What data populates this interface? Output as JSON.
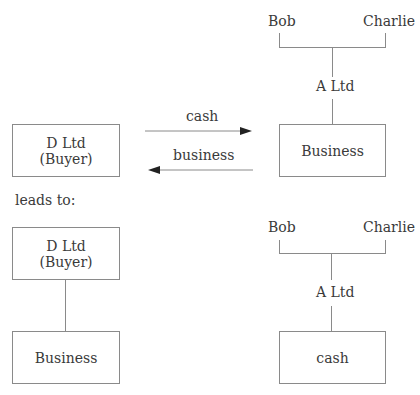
{
  "before": {
    "buyer_box": {
      "line1": "D Ltd",
      "line2": "(Buyer)"
    },
    "arrow_top_label": "cash",
    "arrow_bottom_label": "business",
    "shareholders": [
      "Bob",
      "Charlie"
    ],
    "company": "A Ltd",
    "asset_box": "Business"
  },
  "transition_label": "leads to:",
  "after": {
    "buyer_box": {
      "line1": "D Ltd",
      "line2": "(Buyer)"
    },
    "buyer_asset_box": "Business",
    "shareholders": [
      "Bob",
      "Charlie"
    ],
    "company": "A Ltd",
    "asset_box": "cash"
  }
}
